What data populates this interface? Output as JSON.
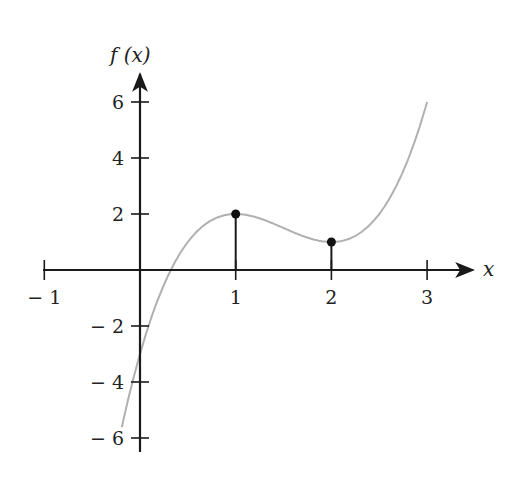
{
  "chart_data": {
    "type": "line",
    "title": "",
    "xlabel": "x",
    "ylabel": "f (x)",
    "xlim": [
      -1,
      3.5
    ],
    "ylim": [
      -6.5,
      7
    ],
    "grid": false,
    "legend": null,
    "x_ticks": [
      -1,
      1,
      2,
      3
    ],
    "x_tick_labels": [
      "− 1",
      "1",
      "2",
      "3"
    ],
    "y_ticks": [
      -6,
      -4,
      -2,
      2,
      4,
      6
    ],
    "y_tick_labels": [
      "− 6",
      "− 4",
      "− 2",
      "2",
      "4",
      "6"
    ],
    "series": [
      {
        "name": "f(x)",
        "color": "#b0b0b0",
        "x_range": [
          -0.19,
          3.0
        ],
        "points": [
          [
            -0.19,
            -5.6
          ],
          [
            0,
            -3
          ],
          [
            0.25,
            -0.53
          ],
          [
            0.5,
            1
          ],
          [
            0.75,
            1.78
          ],
          [
            1,
            2
          ],
          [
            1.25,
            1.84
          ],
          [
            1.5,
            1.5
          ],
          [
            1.75,
            1.16
          ],
          [
            2,
            1
          ],
          [
            2.25,
            1.22
          ],
          [
            2.5,
            2
          ],
          [
            2.75,
            3.53
          ],
          [
            3,
            6
          ]
        ]
      }
    ],
    "marked_points": [
      {
        "x": 1,
        "y": 2,
        "label": "local maximum"
      },
      {
        "x": 2,
        "y": 1,
        "label": "local minimum"
      }
    ],
    "annotations": [
      "vertical line segments from x-axis to each marked point"
    ]
  },
  "labels": {
    "y_axis": "f (x)",
    "x_axis": "x"
  }
}
